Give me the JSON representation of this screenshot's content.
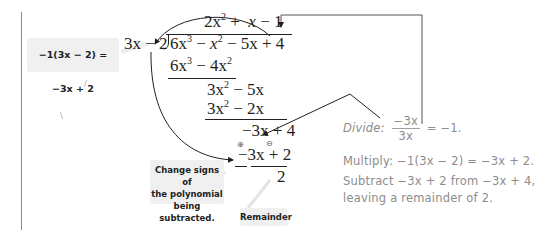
{
  "diagram": {
    "side_note": {
      "text": "−1(3x − 2) = −3x + 2"
    },
    "division": {
      "divisor": "3x − 2",
      "quotient": [
        "2x",
        "2",
        " + ",
        "x",
        " − 1"
      ],
      "dividend": [
        "6x",
        "3",
        " − ",
        "x",
        "2",
        " − 5x + 4"
      ],
      "steps": [
        {
          "a": "6x",
          "ae": "3",
          "b": " − 4x",
          "be": "2"
        },
        {
          "a": "3x",
          "ae": "2",
          "b": " − 5x"
        },
        {
          "a": "3x",
          "ae": "2",
          "b": " − 2x"
        },
        {
          "text_a": "−3x",
          "text_b": " + 4"
        },
        {
          "text_a": "−3x",
          "text_b": " + 2"
        }
      ],
      "remainder": "2",
      "sign_marks": [
        "⊕",
        "⊖"
      ]
    },
    "explanation": {
      "divide_label": "Divide:",
      "divide_num": "−3x",
      "divide_den": "3x",
      "divide_result": "= −1.",
      "multiply": "Multiply: −1(3x − 2) = −3x + 2.",
      "subtract_line1": "Subtract −3x + 2 from −3x + 4,",
      "subtract_line2": "leaving a remainder of 2."
    },
    "callouts": {
      "change_signs": [
        "Change signs of",
        "the polynomial",
        "being subtracted."
      ],
      "remainder": "Remainder"
    },
    "colors": {
      "ink": "#231f20",
      "annotation_gray": "#8c8c8c",
      "label_bg": "#f0f0f0",
      "rule": "#8a8a8a"
    }
  }
}
